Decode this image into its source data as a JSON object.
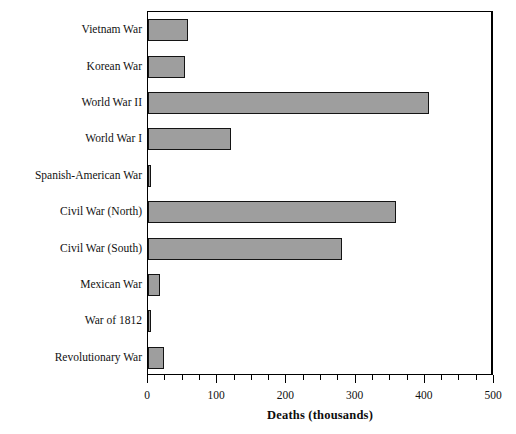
{
  "chart_data": {
    "type": "bar",
    "orientation": "horizontal",
    "title": "",
    "xlabel": "Deaths (thousands)",
    "ylabel": "",
    "xlim": [
      0,
      500
    ],
    "xticks": [
      0,
      100,
      200,
      300,
      400,
      500
    ],
    "xtick_labels": [
      "0",
      "100",
      "200",
      "300",
      "400",
      "500"
    ],
    "minor_tick_step": 25,
    "grid": false,
    "legend": null,
    "categories": [
      "Vietnam War",
      "Korean War",
      "World War II",
      "World War I",
      "Spanish-American War",
      "Civil War (North)",
      "Civil War (South)",
      "Mexican War",
      "War of 1812",
      "Revolutionary War"
    ],
    "values": [
      58,
      54,
      406,
      120,
      4,
      359,
      280,
      17,
      3,
      23
    ],
    "bar_fill_color": "#9e9e9e",
    "bar_edge_color": "#141414"
  }
}
